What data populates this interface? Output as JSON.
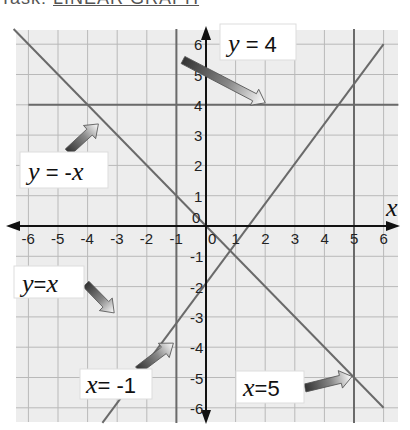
{
  "page": {
    "title_prefix": "Task: ",
    "title_link": "LINEAR GRAPH"
  },
  "chart_data": {
    "type": "line",
    "title": "",
    "xlabel": "x",
    "ylabel": "",
    "xlim": [
      -6,
      6
    ],
    "ylim": [
      -6,
      6
    ],
    "grid": true,
    "x_ticks": [
      "-6",
      "-5",
      "-4",
      "-3",
      "-2",
      "-1",
      "0",
      "1",
      "2",
      "3",
      "4",
      "5",
      "6"
    ],
    "y_ticks": [
      "6",
      "5",
      "4",
      "3",
      "2",
      "1",
      "0",
      "-1",
      "-2",
      "-3",
      "-4",
      "-5",
      "-6"
    ],
    "series": [
      {
        "name": "y = 4",
        "kind": "horizontal",
        "y": 4,
        "points": [
          [
            -6,
            4
          ],
          [
            6.5,
            4
          ]
        ]
      },
      {
        "name": "y = -x",
        "kind": "line",
        "points": [
          [
            -6.5,
            6.5
          ],
          [
            6,
            -6
          ]
        ]
      },
      {
        "name": "y = x",
        "kind": "line",
        "points": [
          [
            -3.5,
            -6.5
          ],
          [
            6,
            6
          ]
        ]
      },
      {
        "name": "x = -1",
        "kind": "vertical",
        "x": -1,
        "points": [
          [
            -1,
            6.5
          ],
          [
            -1,
            -6.5
          ]
        ]
      },
      {
        "name": "x = 5",
        "kind": "vertical",
        "x": 5,
        "points": [
          [
            5,
            6.5
          ],
          [
            5,
            -6.5
          ]
        ]
      }
    ],
    "annotations": [
      {
        "text": "y = 4",
        "points_to": [
          2,
          4
        ]
      },
      {
        "text": "y = -x",
        "points_to": [
          -3.5,
          3.5
        ]
      },
      {
        "text": "y = x",
        "points_to": [
          -3,
          -3
        ]
      },
      {
        "text": "x = -1",
        "points_to": [
          -1,
          -3.8
        ]
      },
      {
        "text": "x = 5",
        "points_to": [
          5,
          -5
        ]
      }
    ]
  },
  "labels": {
    "y4_var": "y",
    "y4_rest": " = 4",
    "ynegx_var": "y",
    "ynegx_eq": " = -",
    "ynegx_x": "x",
    "yx_var": "y",
    "yx_eq": "=",
    "yx_x": "x",
    "xneg1_var": "x",
    "xneg1_rest": "= -1",
    "x5_var": "x",
    "x5_rest": "=5",
    "axis_x": "x",
    "origin": "0"
  }
}
